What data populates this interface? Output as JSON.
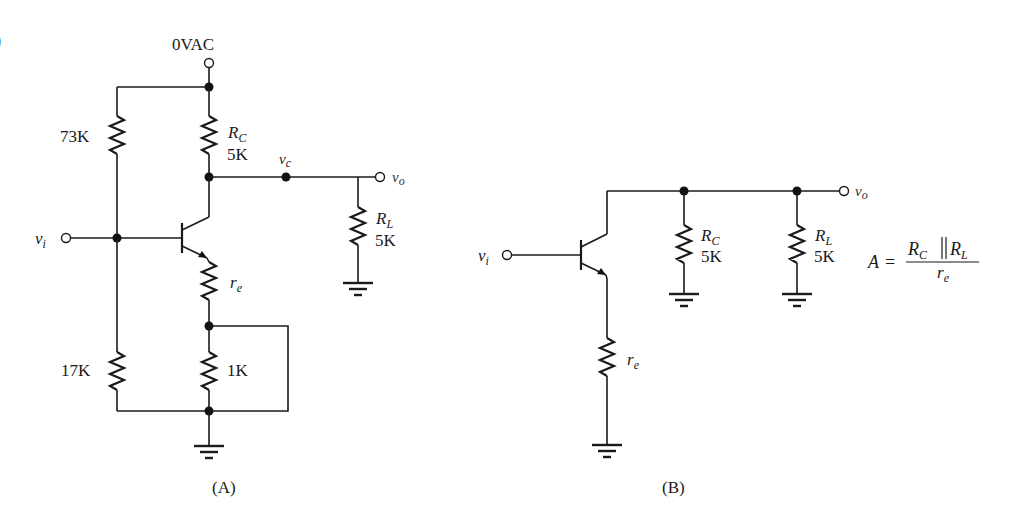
{
  "figure": {
    "edge_glyph": ")",
    "circuit_a": {
      "caption": "(A)",
      "supply_label": "0VAC",
      "input_label": {
        "main": "v",
        "sub": "i"
      },
      "collector_node_label": {
        "main": "v",
        "sub": "c"
      },
      "output_label": {
        "main": "v",
        "sub": "o"
      },
      "r_top_bias": "73K",
      "r_bottom_bias": "17K",
      "rc": {
        "name_main": "R",
        "name_sub": "C",
        "value": "5K"
      },
      "rl": {
        "name_main": "R",
        "name_sub": "L",
        "value": "5K"
      },
      "re": {
        "name_main": "r",
        "name_sub": "e"
      },
      "r_emitter": "1K"
    },
    "circuit_b": {
      "caption": "(B)",
      "input_label": {
        "main": "v",
        "sub": "i"
      },
      "output_label": {
        "main": "v",
        "sub": "o"
      },
      "rc": {
        "name_main": "R",
        "name_sub": "C",
        "value": "5K"
      },
      "rl": {
        "name_main": "R",
        "name_sub": "L",
        "value": "5K"
      },
      "re": {
        "name_main": "r",
        "name_sub": "e"
      }
    },
    "formula": {
      "lhs": "A",
      "equals": "=",
      "num_left_main": "R",
      "num_left_sub": "C",
      "parallel": "||",
      "num_right_main": "R",
      "num_right_sub": "L",
      "den_main": "r",
      "den_sub": "e"
    },
    "colors": {
      "ink": "#1a1a1a",
      "background": "#ffffff"
    }
  }
}
